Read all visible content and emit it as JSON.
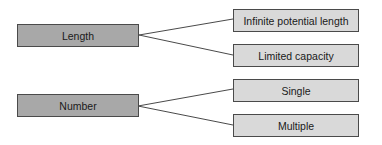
{
  "diagram": {
    "nodes": {
      "length": "Length",
      "number": "Number",
      "infinite": "Infinite potential length",
      "limited": "Limited capacity",
      "single": "Single",
      "multiple": "Multiple"
    },
    "edges": [
      [
        "Length",
        "Infinite potential length"
      ],
      [
        "Length",
        "Limited capacity"
      ],
      [
        "Number",
        "Single"
      ],
      [
        "Number",
        "Multiple"
      ]
    ],
    "colors": {
      "parent_fill": "#a8a8a8",
      "child_fill": "#d9d9d9",
      "stroke": "#4a4a4a"
    }
  }
}
